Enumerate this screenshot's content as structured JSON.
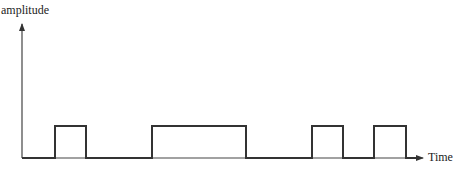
{
  "chart_data": {
    "type": "line",
    "subtype": "pulse-train / square wave",
    "title": "",
    "xlabel": "Time",
    "ylabel": "amplitude",
    "grid": false,
    "legend": null,
    "axes": {
      "origin_px": [
        22,
        158
      ],
      "y_axis_top_px": 22,
      "x_axis_end_px": 423
    },
    "levels": {
      "low": 0,
      "high": 1
    },
    "pulses": [
      {
        "start_px": 55,
        "end_px": 86
      },
      {
        "start_px": 152,
        "end_px": 246
      },
      {
        "start_px": 312,
        "end_px": 343
      },
      {
        "start_px": 374,
        "end_px": 406
      }
    ],
    "baseline_y_px": 158,
    "high_y_px": 126,
    "colors": {
      "line": "#333333",
      "axis": "#444444"
    }
  },
  "labels": {
    "y_axis": "amplitude",
    "x_axis": "Time"
  }
}
